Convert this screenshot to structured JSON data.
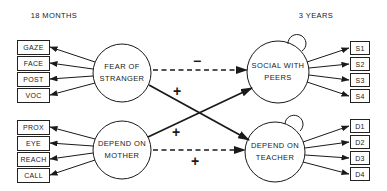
{
  "headers": {
    "left_time": "18 MONTHS",
    "right_time": "3 YEARS"
  },
  "latent_nodes": {
    "fear": {
      "line1": "FEAR OF",
      "line2": "STRANGER"
    },
    "mother": {
      "line1": "DEPEND ON",
      "line2": "MOTHER"
    },
    "social": {
      "line1": "SOCIAL WITH",
      "line2": "PEERS"
    },
    "teacher": {
      "line1": "DEPEND ON",
      "line2": "TEACHER"
    }
  },
  "indicators": {
    "fear": [
      "GAZE",
      "FACE",
      "POST",
      "VOC"
    ],
    "mother": [
      "PROX",
      "EYE",
      "REACH",
      "CALL"
    ],
    "social": [
      "S1",
      "S2",
      "S3",
      "S4"
    ],
    "teacher": [
      "D1",
      "D2",
      "D3",
      "D4"
    ]
  },
  "paths": {
    "fear_to_social": {
      "sign": "−",
      "style": "dashed"
    },
    "fear_to_teacher": {
      "sign": "+",
      "style": "solid"
    },
    "mother_to_social": {
      "sign": "+",
      "style": "solid"
    },
    "mother_to_teacher": {
      "sign": "+",
      "style": "dashed"
    }
  }
}
